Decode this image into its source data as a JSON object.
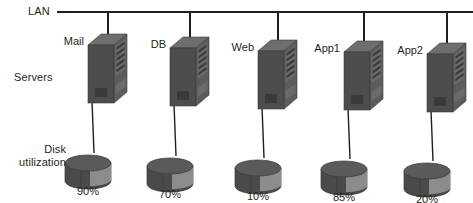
{
  "diagram": {
    "width": 473,
    "height": 203,
    "background_color": "#ffffff",
    "line_color": "#231f20",
    "text_color": "#231f20"
  },
  "labels": {
    "lan": "LAN",
    "servers": "Servers",
    "disk_line1": "Disk",
    "disk_line2": "utilization"
  },
  "bus": {
    "name": "LAN",
    "y": 12,
    "x_start": 57,
    "x_end": 473,
    "stroke_width": 2
  },
  "colors": {
    "server_front": "#4d4d4d",
    "server_top": "#6e6e6e",
    "server_side": "#5c5c5c",
    "server_panel": "#6a6a6a",
    "server_slot": "#3a3a3a",
    "disk_top": "#5a5a5a",
    "disk_body_dark": "#4a4a4a",
    "disk_body_light": "#8c8c8c",
    "disk_outline": "#3a3a3a"
  },
  "nodes": [
    {
      "id": "mail",
      "label": "Mail",
      "drop_x": 108,
      "server_x": 88,
      "server_y": 45,
      "disk_cx": 88,
      "disk_cy": 163,
      "utilization": "90%",
      "utilization_value": 90
    },
    {
      "id": "db",
      "label": "DB",
      "drop_x": 190,
      "server_x": 170,
      "server_y": 48,
      "disk_cx": 170,
      "disk_cy": 166,
      "utilization": "70%",
      "utilization_value": 70
    },
    {
      "id": "web",
      "label": "Web",
      "drop_x": 278,
      "server_x": 258,
      "server_y": 51,
      "disk_cx": 258,
      "disk_cy": 168,
      "utilization": "10%",
      "utilization_value": 10
    },
    {
      "id": "app1",
      "label": "App1",
      "drop_x": 364,
      "server_x": 344,
      "server_y": 52,
      "disk_cx": 344,
      "disk_cy": 169,
      "utilization": "85%",
      "utilization_value": 85
    },
    {
      "id": "app2",
      "label": "App2",
      "drop_x": 447,
      "server_x": 427,
      "server_y": 54,
      "disk_cx": 427,
      "disk_cy": 171,
      "utilization": "20%",
      "utilization_value": 20
    }
  ]
}
